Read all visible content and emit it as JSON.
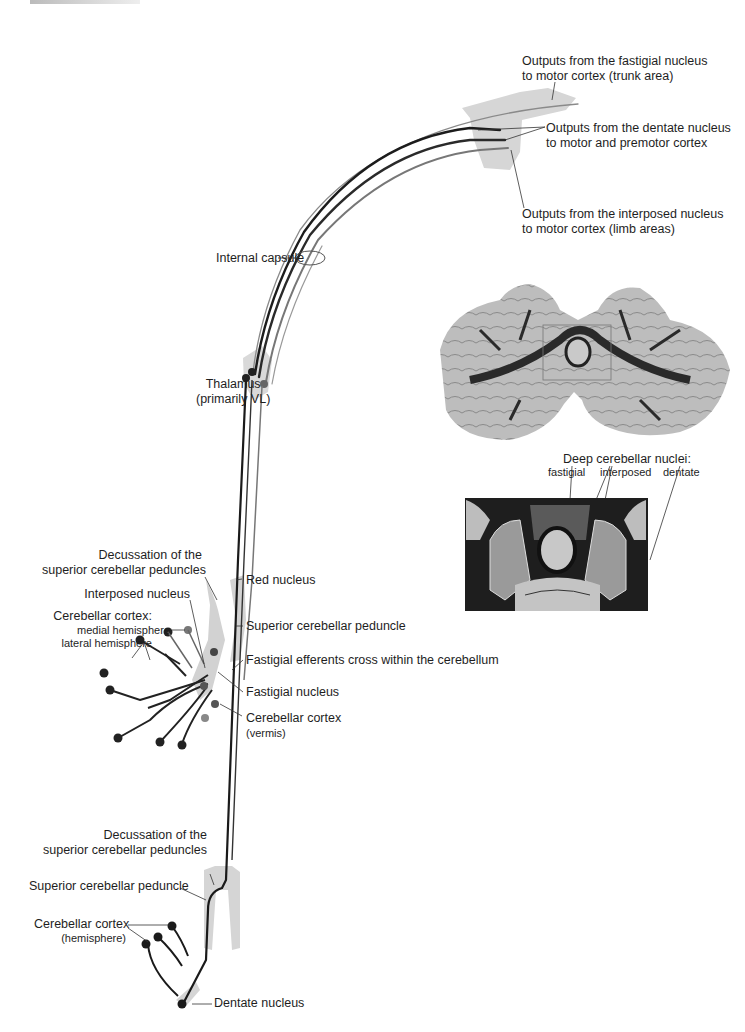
{
  "figure": {
    "colors": {
      "dentate_tract": "#1a1a1a",
      "interposed_tract": "#6a6a6a",
      "fastigial_tract": "#8a8a8a",
      "structure_fill": "#d4d4d4",
      "background": "#ffffff"
    },
    "cortex_labels": {
      "fastigial_output": [
        "Outputs from the fastigial nucleus",
        "to motor cortex (trunk area)"
      ],
      "dentate_output": [
        "Outputs from the dentate nucleus",
        "to motor and premotor cortex"
      ],
      "interposed_output": [
        "Outputs from the interposed nucleus",
        "to motor cortex (limb areas)"
      ]
    },
    "pathway_labels": {
      "internal_capsule": "Internal capsule",
      "thalamus": [
        "Thalamus",
        "(primarily VL)"
      ]
    },
    "upper_cerebellum_labels": {
      "decussation": [
        "Decussation of the",
        "superior cerebellar peduncles"
      ],
      "interposed_nucleus": "Interposed nucleus",
      "cerebellar_cortex": "Cerebellar cortex:",
      "medial_hemisphere": "medial hemisphere",
      "lateral_hemisphere": "lateral hemisphere",
      "red_nucleus": "Red nucleus",
      "superior_cerebellar_peduncle": "Superior cerebellar peduncle",
      "fastigial_efferents": "Fastigial efferents cross within the cerebellum",
      "fastigial_nucleus": "Fastigial nucleus",
      "cerebellar_cortex_vermis": "Cerebellar cortex",
      "vermis": "(vermis)"
    },
    "lower_cerebellum_labels": {
      "decussation": [
        "Decussation of the",
        "superior cerebellar peduncles"
      ],
      "superior_cerebellar_peduncle": "Superior cerebellar peduncle",
      "cerebellar_cortex": "Cerebellar cortex",
      "hemisphere": "(hemisphere)",
      "dentate_nucleus": "Dentate nucleus"
    },
    "histology_panel": {
      "title": "Deep cerebellar nuclei:",
      "nuclei": [
        "fastigial",
        "interposed",
        "dentate"
      ]
    }
  }
}
